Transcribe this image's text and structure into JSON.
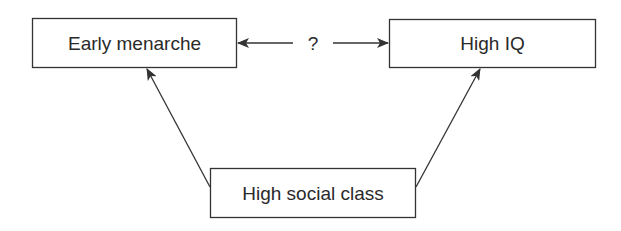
{
  "diagram": {
    "nodes": [
      {
        "id": "early_menarche",
        "label": "Early menarche"
      },
      {
        "id": "high_iq",
        "label": "High IQ"
      },
      {
        "id": "high_social_class",
        "label": "High social class"
      }
    ],
    "edges": [
      {
        "from": "high_social_class",
        "to": "early_menarche",
        "label": ""
      },
      {
        "from": "high_social_class",
        "to": "high_iq",
        "label": ""
      },
      {
        "from": "early_menarche",
        "to": "high_iq",
        "label": "?",
        "bidirectional": true
      }
    ],
    "colors": {
      "stroke": "#333333",
      "text": "#2a2a2a",
      "background": "#ffffff"
    }
  }
}
